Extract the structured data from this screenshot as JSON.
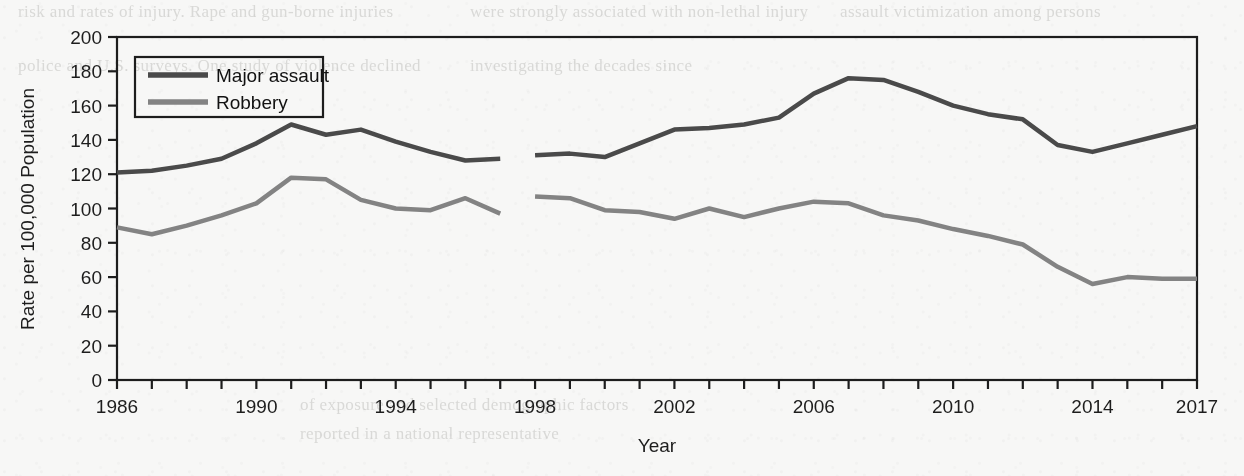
{
  "page": {
    "background_color": "#f7f7f6",
    "ghost_text_lines": [
      {
        "text": "risk and rates of injury. Rape and gun-borne injuries",
        "x": 18,
        "y": 2
      },
      {
        "text": "were strongly associated with non-lethal injury",
        "x": 470,
        "y": 2
      },
      {
        "text": "assault victimization among persons",
        "x": 840,
        "y": 2
      },
      {
        "text": "police and U.S. surveys. One study of violence declined",
        "x": 18,
        "y": 56
      },
      {
        "text": "investigating the decades since",
        "x": 470,
        "y": 56
      },
      {
        "text": "of exposure and selected demographic factors",
        "x": 300,
        "y": 395
      },
      {
        "text": "reported in a national representative",
        "x": 300,
        "y": 424
      }
    ]
  },
  "chart_data": {
    "type": "line",
    "title": "",
    "xlabel": "Year",
    "ylabel": "Rate per 100,000 Population",
    "xlim": [
      1986,
      2017
    ],
    "ylim": [
      0,
      200
    ],
    "y_ticks": [
      0,
      20,
      40,
      60,
      80,
      100,
      120,
      140,
      160,
      180,
      200
    ],
    "x_tick_labels": [
      "1986",
      "1990",
      "1994",
      "1998",
      "2002",
      "2006",
      "2010",
      "2014",
      "2017"
    ],
    "x_tick_label_years": [
      1986,
      1990,
      1994,
      1998,
      2002,
      2006,
      2010,
      2014,
      2017
    ],
    "x_minor_tick_years": [
      1986,
      1987,
      1988,
      1989,
      1990,
      1991,
      1992,
      1993,
      1994,
      1995,
      1996,
      1997,
      1998,
      1999,
      2000,
      2001,
      2002,
      2003,
      2004,
      2005,
      2006,
      2007,
      2008,
      2009,
      2010,
      2011,
      2012,
      2013,
      2014,
      2015,
      2016,
      2017
    ],
    "grid": false,
    "legend_position": "top-left",
    "frame": true,
    "series": [
      {
        "name": "Major assault",
        "color": "#4a4a4a",
        "line_width": 4.5,
        "segments": [
          {
            "x": [
              1986,
              1987,
              1988,
              1989,
              1990,
              1991,
              1992,
              1993,
              1994,
              1995,
              1996,
              1997
            ],
            "values": [
              121,
              122,
              125,
              129,
              138,
              149,
              143,
              146,
              139,
              133,
              128,
              129
            ]
          },
          {
            "x": [
              1998,
              1999,
              2000,
              2001,
              2002,
              2003,
              2004,
              2005,
              2006,
              2007,
              2008,
              2009,
              2010,
              2011,
              2012,
              2013,
              2014,
              2015,
              2016,
              2017
            ],
            "values": [
              131,
              132,
              130,
              138,
              146,
              147,
              149,
              153,
              167,
              176,
              175,
              168,
              160,
              155,
              152,
              137,
              133,
              138,
              143,
              148
            ]
          }
        ]
      },
      {
        "name": "Robbery",
        "color": "#838383",
        "line_width": 4.5,
        "segments": [
          {
            "x": [
              1986,
              1987,
              1988,
              1989,
              1990,
              1991,
              1992,
              1993,
              1994,
              1995,
              1996,
              1997
            ],
            "values": [
              89,
              85,
              90,
              96,
              103,
              118,
              117,
              105,
              100,
              99,
              106,
              97
            ]
          },
          {
            "x": [
              1998,
              1999,
              2000,
              2001,
              2002,
              2003,
              2004,
              2005,
              2006,
              2007,
              2008,
              2009,
              2010,
              2011,
              2012,
              2013,
              2014,
              2015,
              2016,
              2017
            ],
            "values": [
              107,
              106,
              99,
              98,
              94,
              100,
              95,
              100,
              104,
              103,
              96,
              93,
              88,
              84,
              79,
              66,
              56,
              60,
              59,
              59
            ]
          }
        ]
      }
    ]
  },
  "legend": {
    "items": [
      {
        "label": "Major assault",
        "color": "#4a4a4a"
      },
      {
        "label": "Robbery",
        "color": "#838383"
      }
    ]
  }
}
